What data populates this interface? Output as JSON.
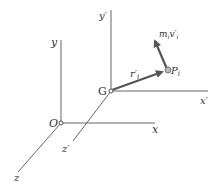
{
  "diagram": {
    "origin_label": "O",
    "axes": {
      "x": "x",
      "y": "y",
      "z": "z"
    },
    "center_label": "G",
    "primed_axes": {
      "x": "x′",
      "y": "y′",
      "z": "z′"
    },
    "particle_label": "P",
    "particle_sub": "i",
    "position_vector": "r′",
    "position_sub": "i",
    "momentum_label_m": "m",
    "momentum_sub_m": "i",
    "momentum_label_v": "v′",
    "momentum_sub_v": "i",
    "colors": {
      "axis": "#555555",
      "vector": "#555555",
      "text": "#333333"
    }
  }
}
